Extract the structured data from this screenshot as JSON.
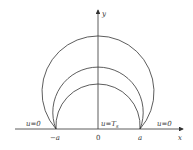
{
  "diagram": {
    "axes": {
      "x_label": "x",
      "y_label": "y",
      "origin_label": "0"
    },
    "ticks": {
      "left": "−a",
      "right": "a"
    },
    "boundary_labels": {
      "left": "u=0",
      "center": "u=T",
      "center_subscript": "s",
      "right": "u=0"
    },
    "circles": [
      {
        "name": "outer",
        "top_y": 36
      },
      {
        "name": "middle",
        "top_y": 67
      },
      {
        "name": "inner",
        "top_y": 84
      }
    ],
    "colors": {
      "line": "#333333",
      "background": "#ffffff"
    }
  }
}
